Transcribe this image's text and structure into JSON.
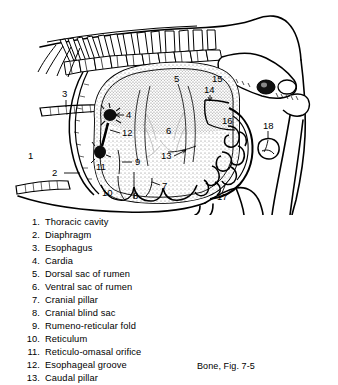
{
  "figure": {
    "caption": "Bone, Fig. 7-5",
    "labels": [
      {
        "id": "1",
        "x": 28,
        "y": 156,
        "name": "Thoracic cavity"
      },
      {
        "id": "2",
        "x": 58,
        "y": 176,
        "name": "Diaphragm"
      },
      {
        "id": "3",
        "x": 63,
        "y": 95,
        "name": "Esophagus"
      },
      {
        "id": "4",
        "x": 127,
        "y": 118,
        "name": "Cardia"
      },
      {
        "id": "5",
        "x": 176,
        "y": 81,
        "name": "Dorsal sac of rumen"
      },
      {
        "id": "6",
        "x": 168,
        "y": 134,
        "name": "Ventral sac of rumen"
      },
      {
        "id": "7",
        "x": 163,
        "y": 188,
        "name": "Cranial pillar"
      },
      {
        "id": "8",
        "x": 133,
        "y": 199,
        "name": "Cranial blind sac"
      },
      {
        "id": "9",
        "x": 135,
        "y": 165,
        "name": "Rumeno-reticular fold"
      },
      {
        "id": "10",
        "x": 103,
        "y": 196,
        "name": "Reticulum"
      },
      {
        "id": "11",
        "x": 100,
        "y": 161,
        "name": "Reticulo-omasal orifice"
      },
      {
        "id": "12",
        "x": 123,
        "y": 136,
        "name": "Esophageal groove"
      },
      {
        "id": "13",
        "x": 165,
        "y": 159,
        "name": "Caudal pillar"
      },
      {
        "id": "14",
        "x": 207,
        "y": 98,
        "name": "Caudal label 14"
      },
      {
        "id": "15",
        "x": 215,
        "y": 83,
        "name": "Caudal label 15"
      },
      {
        "id": "16",
        "x": 224,
        "y": 124,
        "name": "Caudal label 16"
      },
      {
        "id": "17",
        "x": 221,
        "y": 197,
        "name": "Intestinal mass"
      },
      {
        "id": "18",
        "x": 266,
        "y": 125,
        "name": "Label 18"
      }
    ]
  },
  "legend": {
    "items": [
      {
        "num": "1.",
        "text": "Thoracic cavity"
      },
      {
        "num": "2.",
        "text": "Diaphragm"
      },
      {
        "num": "3.",
        "text": "Esophagus"
      },
      {
        "num": "4.",
        "text": "Cardia"
      },
      {
        "num": "5.",
        "text": "Dorsal sac of rumen"
      },
      {
        "num": "6.",
        "text": "Ventral sac of rumen"
      },
      {
        "num": "7.",
        "text": "Cranial pillar"
      },
      {
        "num": "8.",
        "text": "Cranial blind sac"
      },
      {
        "num": "9.",
        "text": "Rumeno-reticular fold"
      },
      {
        "num": "10.",
        "text": "Reticulum"
      },
      {
        "num": "11.",
        "text": "Reticulo-omasal orifice"
      },
      {
        "num": "12.",
        "text": "Esophageal groove"
      },
      {
        "num": "13.",
        "text": "Caudal pillar"
      }
    ]
  },
  "caption": "Bone, Fig. 7-5",
  "colors": {
    "ink": "#000000",
    "paper": "#ffffff",
    "stipple": "#6b6b6b"
  }
}
